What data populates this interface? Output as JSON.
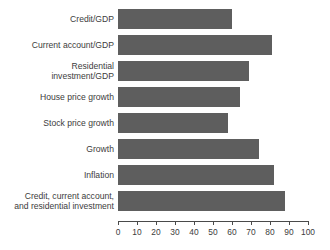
{
  "chart_data": {
    "type": "bar",
    "orientation": "horizontal",
    "title": "",
    "subtitle": "",
    "xlabel": "",
    "ylabel": "",
    "xlim": [
      0,
      100
    ],
    "xticks": [
      "0",
      "10",
      "20",
      "30",
      "40",
      "50",
      "60",
      "70",
      "80",
      "90",
      "100"
    ],
    "grid": false,
    "legend": null,
    "bar_color": "#5e5e5e",
    "axis_color": "#4a4a4a",
    "text_color": "#3c3c3c",
    "categories": [
      "Credit/GDP",
      "Current account/GDP",
      "Residential investment/GDP",
      "House price growth",
      "Stock price growth",
      "Growth",
      "Inflation",
      "Credit, current account, and residential investment"
    ],
    "values": [
      60,
      81,
      69,
      64,
      58,
      74,
      82,
      88
    ],
    "bars": [
      {
        "label_lines": [
          "Credit/GDP"
        ],
        "value": 60
      },
      {
        "label_lines": [
          "Current account/GDP"
        ],
        "value": 81
      },
      {
        "label_lines": [
          "Residential",
          "investment/GDP"
        ],
        "value": 69
      },
      {
        "label_lines": [
          "House price growth"
        ],
        "value": 64
      },
      {
        "label_lines": [
          "Stock price growth"
        ],
        "value": 58
      },
      {
        "label_lines": [
          "Growth"
        ],
        "value": 74
      },
      {
        "label_lines": [
          "Inflation"
        ],
        "value": 82
      },
      {
        "label_lines": [
          "Credit, current account,",
          "and residential investment"
        ],
        "value": 88
      }
    ]
  }
}
